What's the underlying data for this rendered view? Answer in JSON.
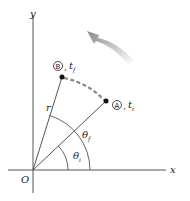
{
  "diagram": {
    "type": "angular-position-diagram",
    "axes": {
      "x_label": "x",
      "y_label": "y",
      "origin_label": "O"
    },
    "radius_label": "r",
    "point_a": {
      "marker": "A",
      "time_label": "t",
      "time_sub": "i"
    },
    "point_b": {
      "marker": "B",
      "time_label": "t",
      "time_sub": "f"
    },
    "angle_initial": {
      "symbol": "θ",
      "sub": "i"
    },
    "angle_final": {
      "symbol": "θ",
      "sub": "f"
    },
    "separator": ",",
    "arrow": {
      "direction": "counterclockwise",
      "color": "#9a9a9a"
    },
    "path_color": "#8a8a8a"
  }
}
